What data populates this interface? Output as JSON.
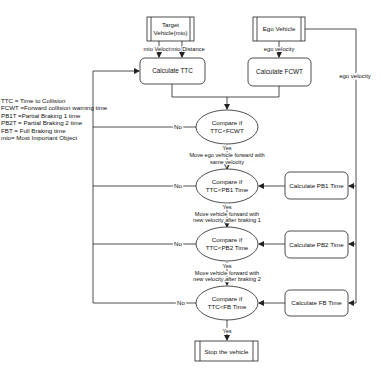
{
  "legend": [
    "TTC = Time to Collision",
    "FCWT =Forward collision warning time",
    "PB1T =Partial Braking 1 time",
    "PB2T = Partial Braking 2 time",
    "FBT  = Full Braking time",
    "mio= Most Important Object"
  ],
  "nodes": {
    "target_vehicle": [
      "Target",
      "Vehicle(mio)"
    ],
    "ego_vehicle": "Ego Vehicle",
    "calc_ttc": "Calculate TTC",
    "calc_fcwt": "Calculate FCWT",
    "compare_fcwt": [
      "Compare if",
      "TTC<FCWT"
    ],
    "compare_pb1": [
      "Compare if",
      "TTC<PB1 Time"
    ],
    "compare_pb2": [
      "Compare if",
      "TTC<PB2 Time"
    ],
    "compare_fb": [
      "Compare if",
      "TTC<FB Time"
    ],
    "calc_pb1": "Calculate PB1 Time",
    "calc_pb2": "Calculate PB2 Time",
    "calc_fb": "Calculate FB Time",
    "stop": "Stop the vehicle"
  },
  "edge_labels": {
    "mio_velocity": "mio Velocity",
    "mio_distance": "mio Distance",
    "ego_velocity_top": "ego velocity",
    "ego_velocity_side": "ego velocity",
    "no": "No",
    "yes": "Yes",
    "action_1": [
      "Move ego vehicle forward with",
      "same velocity"
    ],
    "action_2": [
      "Move vehicle forward with",
      "new velocity after braking 1"
    ],
    "action_3": [
      "Move vehicle forward with",
      "new velocity after braking 2"
    ]
  },
  "colors": {
    "stroke": "#222222",
    "fill": "#ffffff",
    "text": "#111111"
  }
}
